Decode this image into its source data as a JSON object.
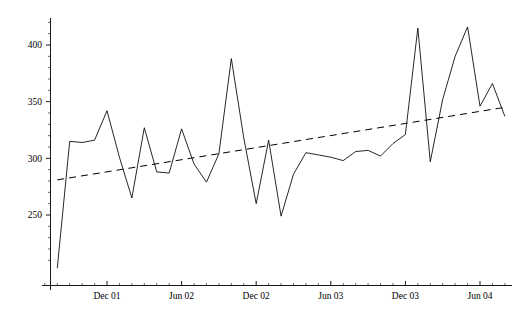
{
  "chart_data": {
    "type": "line",
    "title": "",
    "subtitle": "",
    "xlabel": "",
    "ylabel": "",
    "grid": false,
    "legend": "none",
    "xlim": [
      "2001-07",
      "2004-09"
    ],
    "ylim": [
      200,
      425
    ],
    "y_ticks_major": [
      250,
      300,
      350,
      400
    ],
    "y_tick_labels": [
      "250",
      "300",
      "350",
      "400"
    ],
    "y_minor_tick_step": 10,
    "x_tick_labels": [
      "Dec 01",
      "Jun 02",
      "Dec 02",
      "Jun 03",
      "Dec 03",
      "Jun 04"
    ],
    "x_tick_values": [
      "2001-12",
      "2002-06",
      "2002-12",
      "2003-06",
      "2003-12",
      "2004-06"
    ],
    "x_minor_tick_step_months": 1,
    "series": [
      {
        "name": "observed",
        "style": "solid",
        "color": "#000000",
        "x": [
          "2001-08",
          "2001-09",
          "2001-10",
          "2001-11",
          "2001-12",
          "2002-01",
          "2002-02",
          "2002-03",
          "2002-04",
          "2002-05",
          "2002-06",
          "2002-07",
          "2002-08",
          "2002-09",
          "2002-10",
          "2002-11",
          "2002-12",
          "2003-01",
          "2003-02",
          "2003-03",
          "2003-04",
          "2003-05",
          "2003-06",
          "2003-07",
          "2003-08",
          "2003-09",
          "2003-10",
          "2003-11",
          "2003-12",
          "2004-01",
          "2004-02",
          "2004-03",
          "2004-04",
          "2004-05",
          "2004-06",
          "2004-07",
          "2004-08"
        ],
        "values": [
          203,
          315,
          314,
          316,
          342,
          301,
          265,
          327,
          288,
          287,
          326,
          295,
          279,
          304,
          388,
          318,
          260,
          316,
          249,
          286,
          305,
          303,
          301,
          298,
          306,
          307,
          302,
          313,
          321,
          415,
          297,
          352,
          390,
          416,
          346,
          366,
          337
        ]
      },
      {
        "name": "linear trend",
        "style": "dashed",
        "color": "#000000",
        "x_endpoints": [
          "2001-08",
          "2004-08"
        ],
        "y_endpoints": [
          281,
          345
        ]
      }
    ]
  },
  "axes": {
    "y_axis_name": "value-axis",
    "x_axis_name": "time-axis"
  }
}
